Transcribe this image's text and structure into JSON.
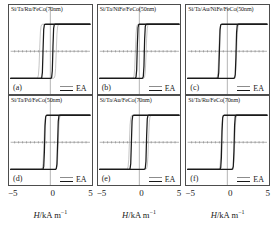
{
  "figure": {
    "xlabel_html": "H/kA m-1",
    "xlabel_var": "H",
    "xlabel_unit": "/kA m",
    "xlabel_exp": "−1",
    "legend_label": "EA",
    "axis_color": "#4d4d4d",
    "loop_thin_color": "#8c8c8c",
    "loop_thick_color": "#1a1a1a",
    "ticks": [
      "−5",
      "0",
      "5"
    ]
  },
  "panels": [
    {
      "letter": "(a)",
      "stack": "Si/Ta/Ru/FeCo(70nm)",
      "legend": "EA"
    },
    {
      "letter": "(b)",
      "stack": "Si/Ta/NiFe/FeCo(50nm)",
      "legend": "EA"
    },
    {
      "letter": "(c)",
      "stack": "Si/Ta/Au/NiFe/FeCo(50nm)",
      "legend": "EA"
    },
    {
      "letter": "(d)",
      "stack": "Si/Ta/Pd/FeCo(50nm)",
      "legend": "EA"
    },
    {
      "letter": "(e)",
      "stack": "Si/Ta/Au/FeCo(70nm)",
      "legend": "EA"
    },
    {
      "letter": "(f)",
      "stack": "Si/Ta/Ru/FeCo(70nm)",
      "legend": "EA"
    }
  ],
  "chart_data": {
    "type": "line",
    "title": "",
    "xlabel": "H/kA m−1",
    "ylabel": "",
    "xlim": [
      -5,
      5
    ],
    "ylim": [
      -1.25,
      1.25
    ],
    "xticks": [
      -5,
      0,
      5
    ],
    "grid": false,
    "legend_position": "bottom-right",
    "legend_entries": [
      "EA"
    ],
    "panel_count": 6,
    "panels": [
      {
        "letter": "(a)",
        "stack": "Si/Ta/Ru/FeCo(70nm)",
        "coercivity_thick": 0.62,
        "coercivity_thin": 1.05,
        "loop_shift": -0.3,
        "squareness": 0.93,
        "series": [
          {
            "name": "EA-thick",
            "style": "thick",
            "color": "#1a1a1a",
            "branch_down_switch": -0.92,
            "branch_up_switch": 0.32
          },
          {
            "name": "EA-thin",
            "style": "thin",
            "color": "#8c8c8c",
            "branch_down_switch": -1.35,
            "branch_up_switch": 0.75
          }
        ]
      },
      {
        "letter": "(b)",
        "stack": "Si/Ta/NiFe/FeCo(50nm)",
        "coercivity_thick": 0.45,
        "coercivity_thin": 0.68,
        "loop_shift": 0.18,
        "squareness": 0.97,
        "series": [
          {
            "name": "EA-thick",
            "style": "thick",
            "color": "#1a1a1a",
            "branch_down_switch": -0.27,
            "branch_up_switch": 0.63
          },
          {
            "name": "EA-thin",
            "style": "thin",
            "color": "#8c8c8c",
            "branch_down_switch": -0.5,
            "branch_up_switch": 0.86
          }
        ]
      },
      {
        "letter": "(c)",
        "stack": "Si/Ta/Au/NiFe/FeCo(50nm)",
        "coercivity_thick": 1.05,
        "coercivity_thin": 1.12,
        "loop_shift": 0.05,
        "squareness": 0.98,
        "series": [
          {
            "name": "EA-thick",
            "style": "thick",
            "color": "#1a1a1a",
            "branch_down_switch": -1.0,
            "branch_up_switch": 1.1
          },
          {
            "name": "EA-thin",
            "style": "thin",
            "color": "#8c8c8c",
            "branch_down_switch": -1.07,
            "branch_up_switch": 1.17
          }
        ]
      },
      {
        "letter": "(d)",
        "stack": "Si/Ta/Pd/FeCo(50nm)",
        "coercivity_thick": 0.82,
        "coercivity_thin": 0.9,
        "loop_shift": 0.1,
        "squareness": 0.96,
        "series": [
          {
            "name": "EA-thick",
            "style": "thick",
            "color": "#1a1a1a",
            "branch_down_switch": -0.72,
            "branch_up_switch": 0.92
          },
          {
            "name": "EA-thin",
            "style": "thin",
            "color": "#8c8c8c",
            "branch_down_switch": -0.8,
            "branch_up_switch": 1.0
          }
        ]
      },
      {
        "letter": "(e)",
        "stack": "Si/Ta/Au/FeCo(70nm)",
        "coercivity_thick": 0.95,
        "coercivity_thin": 1.2,
        "loop_shift": -0.05,
        "squareness": 0.94,
        "series": [
          {
            "name": "EA-thick",
            "style": "thick",
            "color": "#1a1a1a",
            "branch_down_switch": -1.0,
            "branch_up_switch": 0.9
          },
          {
            "name": "EA-thin",
            "style": "thin",
            "color": "#8c8c8c",
            "branch_down_switch": -1.25,
            "branch_up_switch": 1.15
          }
        ]
      },
      {
        "letter": "(f)",
        "stack": "Si/Ta/Ru/FeCo(70nm)",
        "coercivity_thick": 0.78,
        "coercivity_thin": 0.85,
        "loop_shift": 0.08,
        "squareness": 0.96,
        "series": [
          {
            "name": "EA-thick",
            "style": "thick",
            "color": "#1a1a1a",
            "branch_down_switch": -0.7,
            "branch_up_switch": 0.86
          },
          {
            "name": "EA-thin",
            "style": "thin",
            "color": "#8c8c8c",
            "branch_down_switch": -0.77,
            "branch_up_switch": 0.93
          }
        ]
      }
    ]
  }
}
